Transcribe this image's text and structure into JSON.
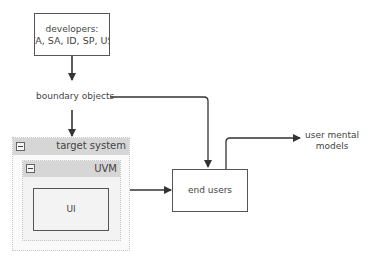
{
  "diagram": {
    "nodes": {
      "developers": {
        "line1": "developers:",
        "line2": "FA, SA, ID, SP, US"
      },
      "boundary_objects": {
        "label": "boundary objects"
      },
      "target_system": {
        "title": "target system",
        "collapse_symbol": "−"
      },
      "uvm": {
        "title": "UVM",
        "collapse_symbol": "−"
      },
      "ui": {
        "label": "UI"
      },
      "end_users": {
        "label": "end users"
      },
      "user_mental_models": {
        "line1": "user mental",
        "line2": "models"
      }
    },
    "edges": [
      {
        "from": "developers",
        "to": "boundary_objects"
      },
      {
        "from": "boundary_objects",
        "to": "target_system"
      },
      {
        "from": "boundary_objects",
        "to": "end_users"
      },
      {
        "from": "uvm",
        "to": "end_users"
      },
      {
        "from": "end_users",
        "to": "user_mental_models"
      }
    ],
    "colors": {
      "line": "#333333",
      "container_header": "#d6d6d6",
      "container_border": "#c8c8c8"
    }
  }
}
